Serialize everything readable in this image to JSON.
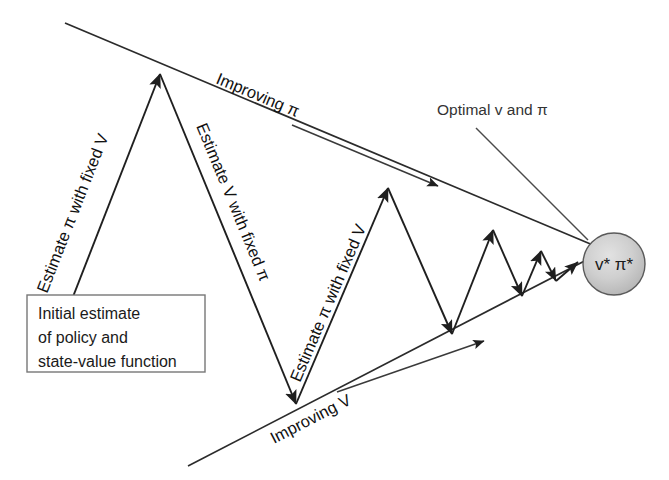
{
  "diagram": {
    "labels": {
      "improving_pi": "Improving π",
      "improving_v": "Improving V",
      "estimate_pi_fixed_v_1": "Estimate π with fixed V",
      "estimate_v_fixed_pi": "Estimate V with fixed π",
      "estimate_pi_fixed_v_2": "Estimate π with fixed V",
      "optimal_callout": "Optimal v and π"
    },
    "initial_box": {
      "line1": "Initial estimate",
      "line2": "of policy and",
      "line3": "state-value function"
    },
    "convergence_node": {
      "label": "v* π*",
      "fill_color": "#c9c9c9",
      "stroke_color": "#555555"
    },
    "colors": {
      "line": "#2b2b2b",
      "text": "#111111",
      "box_border": "#777777",
      "background": "#ffffff"
    }
  }
}
